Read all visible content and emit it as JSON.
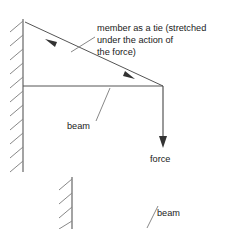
{
  "diagram": {
    "background_color": "#ffffff",
    "line_color": "#555555",
    "hatch_color": "#888888",
    "text_color": "#1a1a1a",
    "labels": {
      "tie_caption_line1": "member as a tie (stretched",
      "tie_caption_line2": "under the action of",
      "tie_caption_line3": "the force)",
      "beam_label_upper": "beam",
      "force_label": "force",
      "beam_label_lower": "beam"
    },
    "icons": {
      "tie_arrow_upper": "arrow-up-left-icon",
      "tie_arrow_lower": "arrow-down-right-icon",
      "force_arrow": "arrow-down-icon",
      "wall_hatch_upper": "wall-hatching-icon",
      "wall_hatch_lower": "wall-hatching-icon"
    },
    "geometry": {
      "wall_upper": {
        "x": 23,
        "y_top": 19,
        "y_bottom": 172,
        "hatch_count": 11,
        "hatch_dx": -13,
        "hatch_dy": 11
      },
      "wall_lower": {
        "x": 72,
        "y_top": 177,
        "y_bottom": 229,
        "hatch_count": 4,
        "hatch_dx": -13,
        "hatch_dy": 11
      },
      "tie": {
        "x1": 25,
        "y1": 22,
        "x2": 163,
        "y2": 86
      },
      "beam": {
        "x1": 23,
        "y1": 86,
        "x2": 163,
        "y2": 86
      },
      "force": {
        "x": 163,
        "y1": 86,
        "y2": 147
      },
      "tie_arrow_upper": {
        "x": 51,
        "y": 42
      },
      "tie_arrow_lower": {
        "x": 128,
        "y": 76
      },
      "leader_caption": {
        "x1": 95,
        "y1": 37,
        "x2": 72,
        "y2": 52
      },
      "leader_beam_upper": {
        "x1": 96,
        "y1": 120,
        "x2": 110,
        "y2": 88
      },
      "leader_beam_lower": {
        "x1": 148,
        "y1": 226,
        "x2": 158,
        "y2": 206
      }
    },
    "text_positions": {
      "caption_x": 97,
      "caption_y1": 31,
      "caption_y2": 43,
      "caption_y3": 55,
      "beam_upper_x": 67,
      "beam_upper_y": 129,
      "force_x": 150,
      "force_y": 162,
      "beam_lower_x": 157,
      "beam_lower_y": 216
    }
  }
}
